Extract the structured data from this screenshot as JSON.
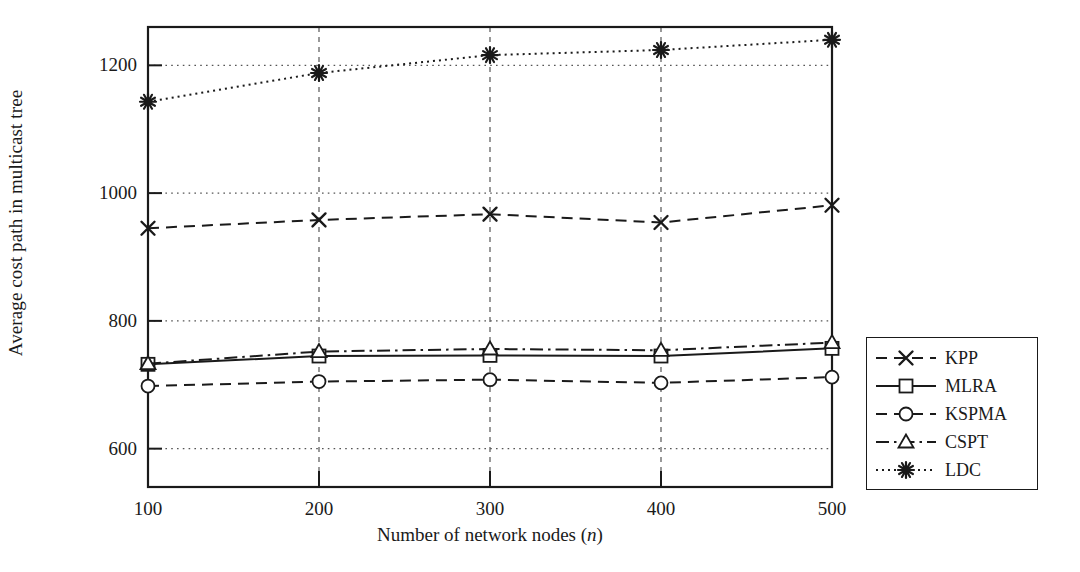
{
  "chart_data": {
    "type": "line",
    "title": "",
    "xlabel": "Number of network nodes (n)",
    "xlabel_prefix": "Number of network nodes (",
    "xlabel_italic": "n",
    "xlabel_suffix": ")",
    "ylabel": "Average cost path in multicast tree",
    "x": [
      100,
      200,
      300,
      400,
      500
    ],
    "xticklabels": [
      "100",
      "200",
      "300",
      "400",
      "500"
    ],
    "yticks": [
      600,
      800,
      1000,
      1200
    ],
    "yticklabels": [
      "600",
      "800",
      "1000",
      "1200"
    ],
    "xlim": [
      100,
      500
    ],
    "ylim": [
      540,
      1260
    ],
    "grid": "dotted-horizontal-and-dashed-vertical",
    "legend_position": "right-outside",
    "series": [
      {
        "name": "KPP",
        "values": [
          945,
          958,
          967,
          954,
          981
        ],
        "marker": "x",
        "dash": "dashed",
        "color": "#1a1a1a"
      },
      {
        "name": "MLRA",
        "values": [
          732,
          745,
          746,
          745,
          757
        ],
        "marker": "square",
        "dash": "solid",
        "color": "#1a1a1a"
      },
      {
        "name": "KSPMA",
        "values": [
          698,
          705,
          708,
          703,
          712
        ],
        "marker": "circle",
        "dash": "dashed",
        "color": "#1a1a1a"
      },
      {
        "name": "CSPT",
        "values": [
          733,
          752,
          756,
          754,
          766
        ],
        "marker": "triangle",
        "dash": "dash-dot",
        "color": "#1a1a1a"
      },
      {
        "name": "LDC",
        "values": [
          1143,
          1188,
          1216,
          1224,
          1240
        ],
        "marker": "asterisk",
        "dash": "dotted",
        "color": "#1a1a1a"
      }
    ]
  },
  "legend": {
    "items": [
      {
        "label": "KPP"
      },
      {
        "label": "MLRA"
      },
      {
        "label": "KSPMA"
      },
      {
        "label": "CSPT"
      },
      {
        "label": "LDC"
      }
    ]
  },
  "colors": {
    "ink": "#1a1a1a",
    "background": "#ffffff",
    "grid": "#555555"
  }
}
